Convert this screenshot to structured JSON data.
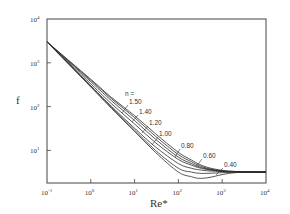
{
  "chart_data": {
    "type": "line",
    "title": "",
    "xlabel": "Re*",
    "ylabel": "f",
    "xscale": "log",
    "yscale": "log",
    "xlim": [
      0.1,
      10000
    ],
    "ylim": [
      1.8,
      10000
    ],
    "grid": false,
    "legend_position": "inline labels near curves",
    "legend_header": "n =",
    "x_ticks": [
      {
        "base": "10",
        "exp": "-1"
      },
      {
        "base": "10",
        "exp": "0"
      },
      {
        "base": "10",
        "exp": "1"
      },
      {
        "base": "10",
        "exp": "2"
      },
      {
        "base": "10",
        "exp": "3"
      },
      {
        "base": "10",
        "exp": "4"
      }
    ],
    "y_ticks": [
      {
        "base": "10",
        "exp": "1"
      },
      {
        "base": "10",
        "exp": "2"
      },
      {
        "base": "10",
        "exp": "3"
      },
      {
        "base": "10",
        "exp": "4"
      }
    ],
    "x": [
      0.1,
      1,
      3,
      10,
      30,
      100,
      200,
      300,
      500,
      1000,
      2000,
      5000,
      10000
    ],
    "series": [
      {
        "name": "1.50",
        "values": [
          3000,
          420,
          160,
          62,
          24,
          9.0,
          6.0,
          4.8,
          4.0,
          3.5,
          3.3,
          3.2,
          3.2
        ]
      },
      {
        "name": "1.40",
        "values": [
          3000,
          400,
          150,
          56,
          21,
          8.0,
          5.5,
          4.5,
          3.8,
          3.4,
          3.3,
          3.2,
          3.2
        ]
      },
      {
        "name": "1.20",
        "values": [
          3000,
          370,
          135,
          48,
          18,
          7.0,
          5.0,
          4.2,
          3.7,
          3.4,
          3.2,
          3.2,
          3.2
        ]
      },
      {
        "name": "1.00",
        "values": [
          3000,
          330,
          115,
          40,
          15,
          6.2,
          4.6,
          4.0,
          3.6,
          3.3,
          3.2,
          3.2,
          3.2
        ]
      },
      {
        "name": "0.80",
        "values": [
          3000,
          300,
          100,
          32,
          12,
          5.0,
          3.9,
          3.6,
          3.4,
          3.3,
          3.2,
          3.2,
          3.2
        ]
      },
      {
        "name": "0.60",
        "values": [
          3000,
          290,
          95,
          29,
          10,
          3.9,
          3.2,
          3.0,
          3.0,
          3.1,
          3.2,
          3.2,
          3.2
        ]
      },
      {
        "name": "0.40",
        "values": [
          3000,
          280,
          90,
          27,
          9.0,
          3.2,
          2.5,
          2.3,
          2.4,
          2.8,
          3.1,
          3.2,
          3.2
        ]
      }
    ]
  }
}
